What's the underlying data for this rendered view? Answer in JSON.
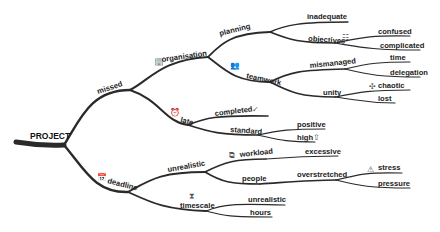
{
  "root": "PROJECT",
  "nodes": {
    "missed": "missed",
    "organisation": "organisation",
    "planning": "planning",
    "inadequate": "inadequate",
    "objectives": "objectives",
    "confused": "confused",
    "complicated": "complicated",
    "teamwork": "teamwork",
    "mismanaged": "mismanaged",
    "time": "time",
    "delegation": "delegation",
    "unity": "unity",
    "chaotic": "chaotic",
    "lost": "lost",
    "late": "late",
    "completed": "completed",
    "standard": "standard",
    "positive": "positive",
    "high": "high",
    "deadline": "deadline",
    "unrealistic1": "unrealistic",
    "workload": "workload",
    "excessive": "excessive",
    "people": "people",
    "overstretched": "overstretched",
    "stress": "stress",
    "pressure": "pressure",
    "timescale": "timescale",
    "unrealistic2": "unrealistic",
    "hours": "hours"
  },
  "icons": {
    "organisation": "🏢",
    "teamwork": "👥",
    "objectives": "☷",
    "chaotic": "✣",
    "late": "⏰",
    "completed": "✓",
    "high": "⇧",
    "deadline": "📅",
    "workload": "⧉",
    "stress": "⚠",
    "timescale": "⧗"
  }
}
